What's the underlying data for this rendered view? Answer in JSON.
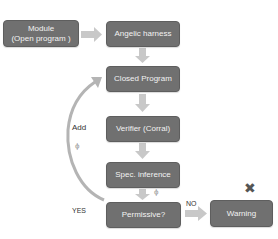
{
  "diagram": {
    "nodes": [
      {
        "id": "module",
        "line1": "Module",
        "line2": "(Open program )"
      },
      {
        "id": "angelic",
        "label": "Angelic harness"
      },
      {
        "id": "closed",
        "label": "Closed Program"
      },
      {
        "id": "verifier",
        "label": "Verifier (Corral)"
      },
      {
        "id": "spec",
        "label": "Spec. inference"
      },
      {
        "id": "permissive",
        "label": "Permissive?"
      },
      {
        "id": "warning",
        "label": "Warning"
      }
    ],
    "edge_labels": {
      "add": "Add",
      "phi_loop": "ϕ",
      "phi_spec": "ϕ",
      "yes": "YES",
      "no": "NO"
    },
    "icons": {
      "reject": "✖"
    },
    "colors": {
      "box": "#707070",
      "arrow": "#c8c8c8",
      "text": "#333333"
    }
  }
}
